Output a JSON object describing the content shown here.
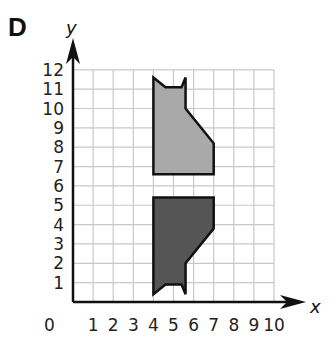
{
  "panel": {
    "label": "D"
  },
  "axes": {
    "x_label": "x",
    "y_label": "y",
    "origin_label": "0",
    "x_ticks": [
      "1",
      "2",
      "3",
      "4",
      "5",
      "6",
      "7",
      "8",
      "9",
      "10"
    ],
    "y_ticks": [
      "1",
      "2",
      "3",
      "4",
      "5",
      "6",
      "7",
      "8",
      "9",
      "10",
      "11",
      "12"
    ]
  },
  "shapes": {
    "original": {
      "name": "light-gray cat shape",
      "fill": "#a9a9a9",
      "vertices": [
        [
          4,
          11.6
        ],
        [
          4.6,
          11.1
        ],
        [
          5.4,
          11.1
        ],
        [
          5.6,
          11.6
        ],
        [
          5.6,
          10
        ],
        [
          7,
          8.2
        ],
        [
          7,
          6.6
        ],
        [
          4,
          6.6
        ]
      ]
    },
    "image": {
      "name": "dark-gray reflected cat shape",
      "fill": "#555555",
      "vertices": [
        [
          4,
          0.4
        ],
        [
          4.6,
          0.9
        ],
        [
          5.4,
          0.9
        ],
        [
          5.6,
          0.4
        ],
        [
          5.6,
          2
        ],
        [
          7,
          3.8
        ],
        [
          7,
          5.4
        ],
        [
          4,
          5.4
        ]
      ]
    }
  },
  "colors": {
    "grid": "#c8c8c8",
    "axis": "#111111",
    "outline": "#111111"
  }
}
